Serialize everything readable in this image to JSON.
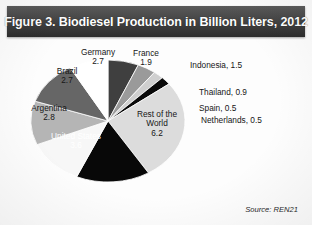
{
  "header": {
    "title": "Figure 3. Biodiesel Production in Billion Liters, 2012"
  },
  "source": {
    "text": "Source: REN21"
  },
  "labels": {
    "indonesia": "Indonesia, 1.5",
    "thailand": "Thailand, 0.9",
    "spain": "Spain, 0.5",
    "netherlands": "Netherlands, 0.5",
    "rest_name": "Rest of the",
    "rest_name2": "World",
    "rest_value": "6.2",
    "us_name": "United States",
    "us_value": "3.6",
    "argentina_name": "Argentina",
    "argentina_value": "2.8",
    "brazil_name": "Brazil",
    "brazil_value": "2.7",
    "germany_name": "Germany",
    "germany_value": "2.7",
    "france_name": "France",
    "france_value": "1.9"
  },
  "chart_data": {
    "type": "pie",
    "title": "Figure 3. Biodiesel Production in Billion Liters, 2012",
    "unit": "Billion Liters",
    "year": 2012,
    "source": "REN21",
    "total": 21.3,
    "legend": "none",
    "labels_inline": true,
    "start_angle_deg": 0,
    "direction": "clockwise",
    "categories": [
      "Indonesia",
      "Thailand",
      "Spain",
      "Netherlands",
      "Rest of the World",
      "United States",
      "Argentina",
      "Brazil",
      "Germany",
      "France"
    ],
    "values": [
      1.5,
      0.9,
      0.5,
      0.5,
      6.2,
      3.6,
      2.8,
      2.7,
      2.7,
      1.9
    ],
    "colors": [
      "#3f3f3f",
      "#9a9a9a",
      "#cfcfcf",
      "#0a0a0a",
      "#dcdcdc",
      "#080808",
      "#f7f7f7",
      "#b5b5b5",
      "#666666",
      "#ffffff"
    ],
    "slices": [
      {
        "name": "Indonesia",
        "value": 1.5,
        "percent": 7.0,
        "color": "#3f3f3f"
      },
      {
        "name": "Thailand",
        "value": 0.9,
        "percent": 4.2,
        "color": "#9a9a9a"
      },
      {
        "name": "Spain",
        "value": 0.5,
        "percent": 2.3,
        "color": "#cfcfcf"
      },
      {
        "name": "Netherlands",
        "value": 0.5,
        "percent": 2.3,
        "color": "#0a0a0a"
      },
      {
        "name": "Rest of the World",
        "value": 6.2,
        "percent": 29.1,
        "color": "#dcdcdc"
      },
      {
        "name": "United States",
        "value": 3.6,
        "percent": 16.9,
        "color": "#080808"
      },
      {
        "name": "Argentina",
        "value": 2.8,
        "percent": 13.1,
        "color": "#f7f7f7"
      },
      {
        "name": "Brazil",
        "value": 2.7,
        "percent": 12.7,
        "color": "#b5b5b5"
      },
      {
        "name": "Germany",
        "value": 2.7,
        "percent": 12.7,
        "color": "#666666"
      },
      {
        "name": "France",
        "value": 1.9,
        "percent": 8.9,
        "color": "#ffffff"
      }
    ]
  }
}
